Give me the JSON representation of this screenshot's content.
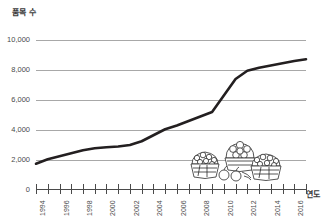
{
  "chart_data": {
    "type": "line",
    "title": "",
    "ylabel": "품목 수",
    "xlabel": "연도",
    "ylim": [
      0,
      10000
    ],
    "xlim": [
      1994,
      2017
    ],
    "grid": true,
    "legend": "none",
    "y_ticks": [
      "0",
      "2,000",
      "4,000",
      "6,000",
      "8,000",
      "10,000"
    ],
    "y_tick_values": [
      0,
      2000,
      4000,
      6000,
      8000,
      10000
    ],
    "x_tick_labels": [
      "1994",
      "1996",
      "1998",
      "2000",
      "2002",
      "2004",
      "2006",
      "2008",
      "2010",
      "2012",
      "2014",
      "2016"
    ],
    "x_tick_values": [
      1994,
      1996,
      1998,
      2000,
      2002,
      2004,
      2006,
      2008,
      2010,
      2012,
      2014,
      2016
    ],
    "x": [
      1994,
      1995,
      1996,
      1997,
      1998,
      1999,
      2000,
      2001,
      2002,
      2003,
      2004,
      2005,
      2006,
      2007,
      2008,
      2009,
      2010,
      2011,
      2012,
      2013,
      2014,
      2015,
      2016,
      2017
    ],
    "values": [
      1750,
      2050,
      2250,
      2450,
      2650,
      2780,
      2850,
      2900,
      3000,
      3250,
      3650,
      4050,
      4300,
      4600,
      4900,
      5200,
      6300,
      7400,
      7950,
      8150,
      8300,
      8450,
      8600,
      8720
    ],
    "series": [
      {
        "name": "품목 수",
        "color": "#231f20",
        "values": [
          1750,
          2050,
          2250,
          2450,
          2650,
          2780,
          2850,
          2900,
          3000,
          3250,
          3650,
          4050,
          4300,
          4600,
          4900,
          5200,
          6300,
          7400,
          7950,
          8150,
          8300,
          8450,
          8600,
          8720
        ]
      }
    ],
    "annotations": [
      {
        "name": "fruit-baskets-illustration",
        "description": "hand-drawn baskets of fruit"
      }
    ]
  },
  "colors": {
    "line": "#231f20",
    "gridline": "#a8a8a8",
    "axis": "#4a4a4a",
    "text": "#4a4a4a",
    "background": "#ffffff"
  }
}
